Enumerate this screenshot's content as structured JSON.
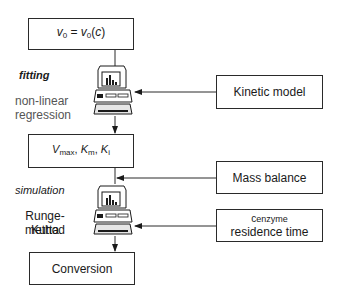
{
  "boxes": {
    "initial_rate": {
      "lhs": "v",
      "lhs_sub": "0",
      "eq": " = ",
      "rhs": "v",
      "rhs_sub": "0",
      "rhs_arg_open": "(",
      "rhs_arg": "c",
      "rhs_arg_close": ")"
    },
    "parameters": {
      "v": "V",
      "v_sub": "max",
      "sep1": ", ",
      "km": "K",
      "km_sub": "m",
      "sep2": ", ",
      "ki": "K",
      "ki_sub": "i"
    },
    "kinetic_model": "Kinetic model",
    "mass_balance": "Mass balance",
    "enzyme": {
      "c": "c",
      "c_sub": "enzyme",
      "line2": "residence time"
    },
    "conversion": "Conversion"
  },
  "labels": {
    "fitting": "fitting",
    "nonlinear_1": "non-linear",
    "nonlinear_2": "regression",
    "simulation": "simulation",
    "runge_1": "Runge-Kutta",
    "runge_2": "method"
  },
  "icons": {
    "computer_1": "computer-icon",
    "computer_2": "computer-icon"
  },
  "colors": {
    "stroke": "#2a2a2a",
    "text": "#1a1a1a",
    "muted_text": "#555555"
  }
}
